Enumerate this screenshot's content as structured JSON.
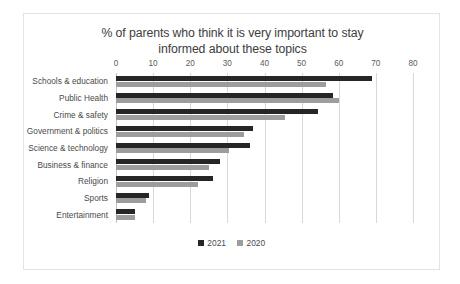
{
  "chart_data": {
    "type": "bar",
    "orientation": "horizontal",
    "title": "% of parents who think it is very important to stay informed about these topics",
    "title_lines": [
      "% of parents who think it is very important to stay",
      "informed about these topics"
    ],
    "categories": [
      "Schools & education",
      "Public Health",
      "Crime & safety",
      "Government & politics",
      "Science & technology",
      "Business & finance",
      "Religion",
      "Sports",
      "Entertainment"
    ],
    "series": [
      {
        "name": "2021",
        "color": "#262626",
        "values": [
          69,
          58.5,
          54.5,
          37,
          36,
          28,
          26,
          9,
          5
        ]
      },
      {
        "name": "2020",
        "color": "#9d9d9d",
        "values": [
          56.5,
          60,
          45.5,
          34.5,
          30.5,
          25,
          22,
          8,
          5
        ]
      }
    ],
    "xlabel": "",
    "ylabel": "",
    "xlim": [
      0,
      80
    ],
    "xticks": [
      0,
      10,
      20,
      30,
      40,
      50,
      60,
      70,
      80
    ],
    "grid": true,
    "legend_position": "bottom"
  },
  "legend": {
    "items": [
      {
        "label": "2021"
      },
      {
        "label": "2020"
      }
    ]
  }
}
